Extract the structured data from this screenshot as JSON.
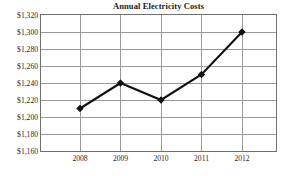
{
  "chart_data": {
    "type": "line",
    "title": "Annual Electricity Costs",
    "xlabel": "",
    "ylabel": "",
    "categories": [
      "2008",
      "2009",
      "2010",
      "2011",
      "2012"
    ],
    "values": [
      1210,
      1240,
      1220,
      1250,
      1300
    ],
    "series": [
      {
        "name": "Annual Electricity Costs",
        "values": [
          1210,
          1240,
          1220,
          1250,
          1300
        ]
      }
    ],
    "ylim": [
      1160,
      1320
    ],
    "y_tick_step": 20,
    "y_tick_labels": [
      "$1,320",
      "$1,300",
      "$1,280",
      "$1,260",
      "$1,240",
      "$1,220",
      "$1,200",
      "$1,180",
      "$1,160"
    ],
    "y_tick_values": [
      1320,
      1300,
      1280,
      1260,
      1240,
      1220,
      1200,
      1180,
      1160
    ],
    "x_tick_labels": [
      "2008",
      "2009",
      "2010",
      "2011",
      "2012"
    ],
    "grid": true,
    "grid_horizontal": true,
    "grid_vertical": true,
    "legend": false,
    "legend_position": "none",
    "marker": "diamond",
    "annotations": [],
    "colors": {
      "line": "#111111",
      "marker": "#111111",
      "grid": "#9a9a9a",
      "border": "#6f6f6f",
      "plot_background": "#ffffff",
      "text": "#1f1f1f",
      "title": "#1a1a1a"
    }
  }
}
